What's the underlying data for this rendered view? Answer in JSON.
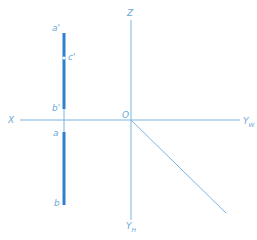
{
  "diagram": {
    "title": "",
    "axes": {
      "z_label": "Z",
      "x_label": "X",
      "origin_label": "O",
      "yw_label": "Y",
      "yw_sub": "W",
      "yh_label": "Y",
      "yh_sub": "H"
    },
    "points": {
      "a_prime": "a'",
      "c_prime": "c'",
      "b_prime": "b'",
      "a": "a",
      "b": "b"
    },
    "colors": {
      "axis": "#7db4e0",
      "segment": "#2f7fd0",
      "label": "#6aa8d8"
    }
  }
}
